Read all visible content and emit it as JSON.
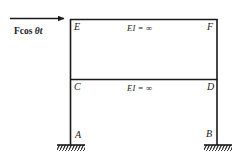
{
  "figure": {
    "type": "structural-frame-diagram",
    "background_color": "#ffffff",
    "line_color": "#1a1a1a",
    "load": {
      "label_prefix": "F",
      "label_cos": "cos ",
      "label_theta": "θt",
      "full_label": "F cos θt",
      "direction": "right",
      "applied_at_node": "E"
    },
    "nodes": {
      "top_left": "E",
      "top_right": "F",
      "mid_left": "C",
      "mid_right": "D",
      "base_left": "A",
      "base_right": "B"
    },
    "members": {
      "top_beam_label": "EI = ∞",
      "mid_beam_label": "EI = ∞"
    },
    "supports": {
      "left_type": "fixed",
      "right_type": "fixed"
    }
  }
}
